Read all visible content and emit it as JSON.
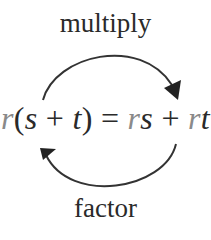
{
  "diagram": {
    "top_label": "multiply",
    "bottom_label": "factor",
    "equation": {
      "lhs": {
        "r": "r",
        "open": "(",
        "s": "s",
        "plus": " + ",
        "t": "t",
        "close": ")"
      },
      "equals": " = ",
      "rhs": {
        "r1": "r",
        "s": "s",
        "plus": " + ",
        "r2": "r",
        "t": "t"
      }
    },
    "arrows": [
      {
        "name": "multiply-arrow",
        "direction": "left-to-right",
        "position": "top"
      },
      {
        "name": "factor-arrow",
        "direction": "right-to-left",
        "position": "bottom"
      }
    ],
    "colors": {
      "text": "#2a2a2a",
      "highlight": "#8a8a8a",
      "arrow": "#333333"
    }
  }
}
